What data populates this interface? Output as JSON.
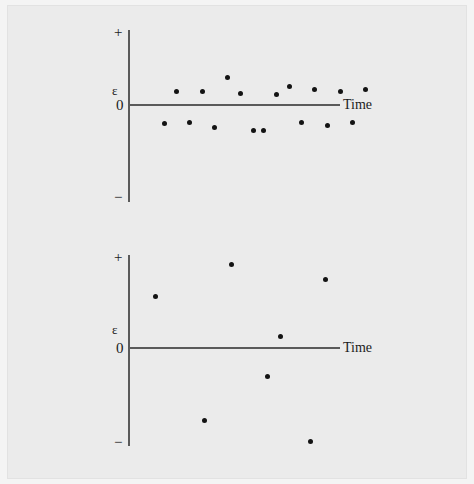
{
  "figure": {
    "caption_present": false,
    "background_color": "#ebebeb",
    "axis_color": "#5a5a5a",
    "point_color": "#131313"
  },
  "panels": [
    {
      "id": "top-panel",
      "name": "residuals-small-scatter",
      "labels": {
        "positive": "+",
        "negative": "−",
        "epsilon": "ε",
        "zero": "0",
        "x_axis": "Time"
      }
    },
    {
      "id": "bottom-panel",
      "name": "residuals-large-scatter",
      "labels": {
        "positive": "+",
        "negative": "−",
        "epsilon": "ε",
        "zero": "0",
        "x_axis": "Time"
      }
    }
  ],
  "chart_data": [
    {
      "type": "scatter",
      "title": "",
      "panel": "top",
      "xlabel": "Time",
      "ylabel": "ε",
      "ytick_labels": [
        "+",
        "ε",
        "0",
        "−"
      ],
      "xlim": [
        0,
        100
      ],
      "ylim": [
        -100,
        100
      ],
      "grid": false,
      "legend": "none",
      "zero_line": true,
      "n_points": 17,
      "x": [
        17,
        23,
        29,
        35,
        41,
        47,
        53,
        59,
        64,
        70,
        76,
        82,
        88,
        94,
        100,
        106,
        112
      ],
      "y": [
        -11,
        8,
        -10,
        8,
        -13,
        16,
        7,
        -15,
        -15,
        6,
        11,
        -10,
        9,
        -12,
        8,
        -10,
        9
      ],
      "points": [
        {
          "x": 17,
          "y": -11
        },
        {
          "x": 23,
          "y": 8
        },
        {
          "x": 29,
          "y": -10
        },
        {
          "x": 35,
          "y": 8
        },
        {
          "x": 41,
          "y": -13
        },
        {
          "x": 47,
          "y": 16
        },
        {
          "x": 53,
          "y": 7
        },
        {
          "x": 59,
          "y": -15
        },
        {
          "x": 64,
          "y": -15
        },
        {
          "x": 70,
          "y": 6
        },
        {
          "x": 76,
          "y": 11
        },
        {
          "x": 82,
          "y": -10
        },
        {
          "x": 88,
          "y": 9
        },
        {
          "x": 94,
          "y": -12
        },
        {
          "x": 100,
          "y": 8
        },
        {
          "x": 106,
          "y": -10
        },
        {
          "x": 112,
          "y": 9
        }
      ]
    },
    {
      "type": "scatter",
      "title": "",
      "panel": "bottom",
      "xlabel": "Time",
      "ylabel": "ε",
      "ytick_labels": [
        "+",
        "ε",
        "0",
        "−"
      ],
      "xlim": [
        0,
        100
      ],
      "ylim": [
        -100,
        100
      ],
      "grid": false,
      "legend": "none",
      "zero_line": true,
      "n_points": 7,
      "x": [
        13,
        36,
        49,
        66,
        72,
        86,
        93
      ],
      "y": [
        40,
        -56,
        64,
        -22,
        9,
        -72,
        53
      ],
      "points": [
        {
          "x": 13,
          "y": 40
        },
        {
          "x": 36,
          "y": -56
        },
        {
          "x": 49,
          "y": 64
        },
        {
          "x": 66,
          "y": -22
        },
        {
          "x": 72,
          "y": 9
        },
        {
          "x": 86,
          "y": -72
        },
        {
          "x": 93,
          "y": 53
        }
      ]
    }
  ]
}
